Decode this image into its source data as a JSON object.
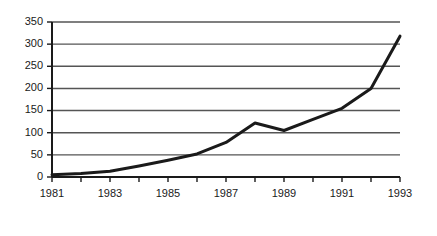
{
  "chart_data": {
    "type": "line",
    "title": "",
    "subtitle": "",
    "xlabel": "",
    "ylabel": "",
    "x": [
      1981,
      1982,
      1983,
      1984,
      1985,
      1986,
      1987,
      1988,
      1989,
      1990,
      1991,
      1992,
      1993
    ],
    "values": [
      5,
      8,
      13,
      25,
      38,
      52,
      78,
      122,
      105,
      130,
      155,
      200,
      318
    ],
    "series": [
      {
        "name": "series-1",
        "values": [
          5,
          8,
          13,
          25,
          38,
          52,
          78,
          122,
          105,
          130,
          155,
          200,
          318
        ]
      }
    ],
    "xlim": [
      1981,
      1993
    ],
    "ylim": [
      0,
      350
    ],
    "y_ticks": [
      0,
      50,
      100,
      150,
      200,
      250,
      300,
      350
    ],
    "y_tick_labels": [
      "0",
      "50",
      "100",
      "150",
      "200",
      "250",
      "300",
      "350"
    ],
    "x_ticks": [
      1981,
      1982,
      1983,
      1984,
      1985,
      1986,
      1987,
      1988,
      1989,
      1990,
      1991,
      1992,
      1993
    ],
    "x_tick_labels": [
      "1981",
      "",
      "1983",
      "",
      "1985",
      "",
      "1987",
      "",
      "1989",
      "",
      "1991",
      "",
      "1993"
    ],
    "x_labeled_ticks": [
      "1981",
      "1983",
      "1985",
      "1987",
      "1989",
      "1991",
      "1993"
    ],
    "grid": true,
    "grid_orientation": "horizontal",
    "legend": false,
    "legend_position": "none",
    "annotations": [],
    "colors": {
      "background": "#ffffff",
      "line": "#1a1a1a",
      "grid": "#555555",
      "axis": "#1a1a1a",
      "tick_label": "#1a1a1a"
    },
    "line_width": 3
  },
  "axes": {
    "y_axis_name": "y-axis",
    "x_axis_name": "x-axis"
  }
}
